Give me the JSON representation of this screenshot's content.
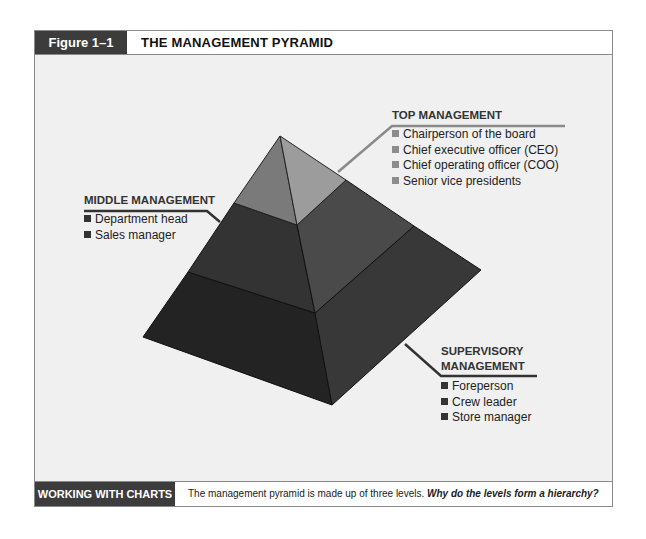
{
  "header": {
    "figure_tag": "Figure 1–1",
    "title": "THE MANAGEMENT PYRAMID"
  },
  "footer": {
    "tag": "WORKING WITH CHARTS",
    "text": "The management pyramid is made up of three levels. ",
    "question": "Why do the levels form a hierarchy?"
  },
  "levels": {
    "top": {
      "title": "TOP MANAGEMENT",
      "items": [
        "Chairperson of the board",
        "Chief executive officer (CEO)",
        "Chief operating officer (COO)",
        "Senior vice presidents"
      ],
      "bullet_color": "#8c8c8c"
    },
    "middle": {
      "title": "MIDDLE MANAGEMENT",
      "items": [
        "Department head",
        "Sales manager"
      ],
      "bullet_color": "#333333"
    },
    "supervisory": {
      "title_line1": "SUPERVISORY",
      "title_line2": "MANAGEMENT",
      "items": [
        "Foreperson",
        "Crew leader",
        "Store manager"
      ],
      "bullet_color": "#333333"
    }
  },
  "colors": {
    "top_left": "#7a7a7a",
    "top_right": "#9a9a9a",
    "middle_left": "#333333",
    "middle_right": "#4a4a4a",
    "bottom_left": "#222222",
    "bottom_right": "#383838",
    "frame_bg": "#f0f0f0",
    "tag_bg": "#3c3c3c"
  }
}
